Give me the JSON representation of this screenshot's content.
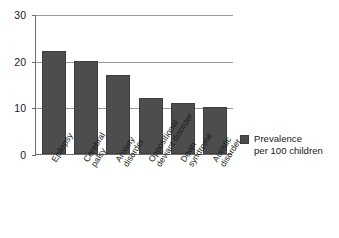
{
  "chart_data": {
    "type": "bar",
    "title": "",
    "xlabel": "",
    "ylabel": "",
    "categories": [
      "Epilepsy",
      "Cerebral palsy",
      "Anxiety disorder",
      "Oppositional deviant disorder",
      "Down syndrome",
      "Autistic disorder"
    ],
    "category_lines": [
      [
        "Epilepsy"
      ],
      [
        "Cerebral",
        "palsy"
      ],
      [
        "Anxiety",
        "disorder"
      ],
      [
        "Oppositional",
        "deviant disorder"
      ],
      [
        "Down",
        "syndrome"
      ],
      [
        "Autistic",
        "disorder"
      ]
    ],
    "values": [
      22,
      20,
      17,
      12,
      11,
      10
    ],
    "series": [
      {
        "name": "Prevalence per 100 children",
        "values": [
          22,
          20,
          17,
          12,
          11,
          10
        ],
        "color": "#4d4d4d"
      }
    ],
    "ylim": [
      0,
      30
    ],
    "yticks": [
      0,
      10,
      20,
      30
    ],
    "ytick_labels": [
      "0",
      "10",
      "20",
      "30"
    ],
    "grid": true,
    "legend_position": "right"
  },
  "legend": {
    "entries": [
      {
        "line1": "Prevalence",
        "line2": "per 100 children",
        "color": "#4d4d4d"
      }
    ]
  },
  "colors": {
    "bar": "#4d4d4d",
    "bar_edge": "#3d3d3d",
    "axis": "#6f6f6f",
    "grid": "#9a9a9a",
    "text": "#1a1a1a",
    "background": "#ffffff"
  }
}
